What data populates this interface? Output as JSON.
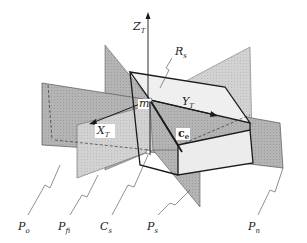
{
  "diagram": {
    "type": "3d-geometry-schematic",
    "axes": {
      "z": {
        "main": "Z",
        "sub": "T"
      },
      "y": {
        "main": "Y",
        "sub": "T"
      },
      "x": {
        "main": "X",
        "sub": "T"
      }
    },
    "points": {
      "m": "m",
      "ce_main": "c",
      "ce_sub": "e"
    },
    "labels": {
      "Rs": {
        "main": "R",
        "sub": "s"
      },
      "Po": {
        "main": "P",
        "sub": "o"
      },
      "Pfi": {
        "main": "P",
        "sub": "fi"
      },
      "Cs": {
        "main": "C",
        "sub": "s"
      },
      "Ps": {
        "main": "P",
        "sub": "s"
      },
      "Pn": {
        "main": "P",
        "sub": "n"
      }
    },
    "colors": {
      "plane_dark": "#a8a8a8",
      "plane_mid": "#c4c4c4",
      "plane_light": "#dcdcdc",
      "box_face": "#ececec",
      "line": "#1a1a1a"
    }
  }
}
